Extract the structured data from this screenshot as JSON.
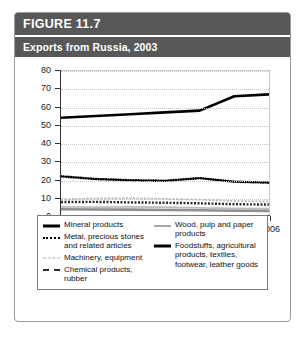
{
  "figure": {
    "number_label": "FIGURE 11.7",
    "caption": "Exports from Russia, 2003"
  },
  "chart_data": {
    "type": "line",
    "title": "Exports from Russia, 2003",
    "xlabel": "Year",
    "ylabel": "",
    "x": [
      2000,
      2001,
      2002,
      2003,
      2004,
      2005,
      2006
    ],
    "xlim": [
      2000,
      2006
    ],
    "ylim": [
      0,
      80
    ],
    "yticks": [
      0,
      10,
      20,
      30,
      40,
      50,
      60,
      70,
      80
    ],
    "xticks": [
      "2000",
      "2001",
      "2002",
      "2003",
      "2004",
      "2005",
      "2006"
    ],
    "grid": true,
    "legend_position": "below",
    "series": [
      {
        "name": "Mineral products",
        "style": "solid-thick-black",
        "color": "#000000",
        "values": [
          54,
          55,
          56,
          57,
          58,
          66,
          67
        ]
      },
      {
        "name": "Metal, precious stones and related articles",
        "style": "dotted-black",
        "color": "#000000",
        "values": [
          21.5,
          20,
          19.3,
          19,
          20.5,
          18.5,
          18
        ]
      },
      {
        "name": "Machinery, equipment",
        "style": "dashed-light-gray",
        "color": "#b4b4b4",
        "values": [
          8.8,
          9.2,
          9.3,
          9,
          8.5,
          7.8,
          7.5
        ]
      },
      {
        "name": "Chemical products, rubber",
        "style": "dashed-dark",
        "color": "#2b2b2b",
        "values": [
          7.2,
          7.3,
          7,
          6.8,
          6.5,
          6,
          5.8
        ]
      },
      {
        "name": "Wood, pulp and paper products",
        "style": "solid-light-gray",
        "color": "#bdbdbd",
        "values": [
          4.5,
          4.4,
          4.5,
          4.3,
          4,
          3.6,
          3.5
        ]
      },
      {
        "name": "Foodstuffs, agricultural products, textiles, footwear, leather goods",
        "style": "solid-thick-gray",
        "color": "#8f8f8f",
        "values": [
          3.2,
          3.1,
          3,
          2.8,
          2.6,
          2.4,
          2.3
        ]
      }
    ]
  },
  "legend": {
    "left_column": [
      {
        "label": "Mineral products",
        "swatch": "sw-solid-thick"
      },
      {
        "label": "Metal, precious stones and related articles",
        "swatch": "sw-dots"
      },
      {
        "label": "Machinery, equipment",
        "swatch": "sw-dash-light"
      },
      {
        "label": "Chemical products, rubber",
        "swatch": "sw-dash-dark"
      }
    ],
    "right_column": [
      {
        "label": "Wood, pulp and paper products",
        "swatch": "sw-solid-gray"
      },
      {
        "label": "Foodstuffs, agricultural products, textiles, footwear, leather goods",
        "swatch": "sw-solid-thick"
      }
    ]
  },
  "colors": {
    "banner_bg": "#585858",
    "banner_text": "#ffffff",
    "card_border": "#9a9a9a",
    "grid": "#c4c4c4",
    "axis": "#333333"
  }
}
